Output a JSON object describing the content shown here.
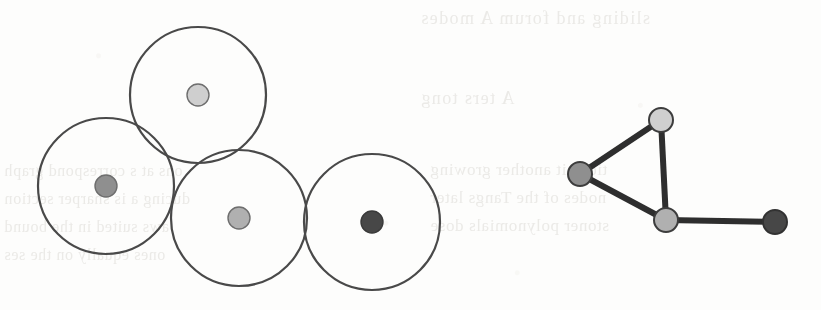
{
  "figure": {
    "background_color": "#fdfdfc",
    "ink_color": "#4a4a4a",
    "edge_color": "#2e2e2e"
  },
  "palette": {
    "node_light": "#cfcfcf",
    "node_medium_light": "#b0b0b0",
    "node_medium": "#8f8f8f",
    "node_dark": "#474747",
    "outline": "#3c3c3c"
  },
  "disk_diagram": {
    "label": "overlapping-unit-disks",
    "disk_radius": 68,
    "stroke_width": 2.2,
    "disks": [
      {
        "id": "top",
        "cx": 198,
        "cy": 95,
        "r": 68,
        "center_dot_color": "#cfcfcf",
        "center_dot_r": 11
      },
      {
        "id": "left",
        "cx": 106,
        "cy": 186,
        "r": 68,
        "center_dot_color": "#8f8f8f",
        "center_dot_r": 11
      },
      {
        "id": "middle",
        "cx": 239,
        "cy": 218,
        "r": 68,
        "center_dot_color": "#b0b0b0",
        "center_dot_r": 11
      },
      {
        "id": "right",
        "cx": 372,
        "cy": 222,
        "r": 68,
        "center_dot_color": "#474747",
        "center_dot_r": 11
      }
    ]
  },
  "graph_diagram": {
    "label": "intersection-graph",
    "node_radius": 12,
    "edge_width": 6,
    "nodes": [
      {
        "id": "top",
        "cx": 661,
        "cy": 120,
        "fill": "#cfcfcf"
      },
      {
        "id": "left",
        "cx": 580,
        "cy": 174,
        "fill": "#8f8f8f"
      },
      {
        "id": "bottom",
        "cx": 666,
        "cy": 220,
        "fill": "#b0b0b0"
      },
      {
        "id": "right",
        "cx": 775,
        "cy": 222,
        "fill": "#474747"
      }
    ],
    "edges": [
      {
        "from": "left",
        "to": "top",
        "x1": 580,
        "y1": 174,
        "x2": 661,
        "y2": 120
      },
      {
        "from": "top",
        "to": "bottom",
        "x1": 661,
        "y1": 120,
        "x2": 666,
        "y2": 220
      },
      {
        "from": "left",
        "to": "bottom",
        "x1": 580,
        "y1": 174,
        "x2": 666,
        "y2": 220
      },
      {
        "from": "bottom",
        "to": "right",
        "x1": 666,
        "y1": 220,
        "x2": 775,
        "y2": 222
      }
    ]
  },
  "bleed_text": {
    "note": "faint mirrored show-through from the reverse side of the scanned page",
    "lines": [
      {
        "id": "bt-head",
        "text": "sliding  and  forum  A  modes",
        "x": 420,
        "y": 8,
        "rotate": 0
      },
      {
        "id": "bt-sub",
        "text": "A  ters  tong",
        "x": 420,
        "y": 88,
        "rotate": 0
      },
      {
        "id": "bt-r1",
        "text": "tions  it  another  growing",
        "x": 430,
        "y": 160,
        "rotate": 0
      },
      {
        "id": "bt-r2",
        "text": "nodes  of  the  Tangs  later",
        "x": 430,
        "y": 188,
        "rotate": 0
      },
      {
        "id": "bt-r3",
        "text": "stoner  polynomials  dose",
        "x": 430,
        "y": 216,
        "rotate": 0
      },
      {
        "id": "bt-l1",
        "text": "ons  at  s  correspond  graph",
        "x": 4,
        "y": 162,
        "rotate": 0
      },
      {
        "id": "bt-l2",
        "text": "ducing  a  is  sharper  section",
        "x": 4,
        "y": 190,
        "rotate": 0
      },
      {
        "id": "bt-l3",
        "text": "aws  suited  in  the  bound",
        "x": 4,
        "y": 218,
        "rotate": 0
      },
      {
        "id": "bt-l4",
        "text": "ones  equally  on  the  ses",
        "x": 4,
        "y": 246,
        "rotate": 0
      }
    ]
  }
}
